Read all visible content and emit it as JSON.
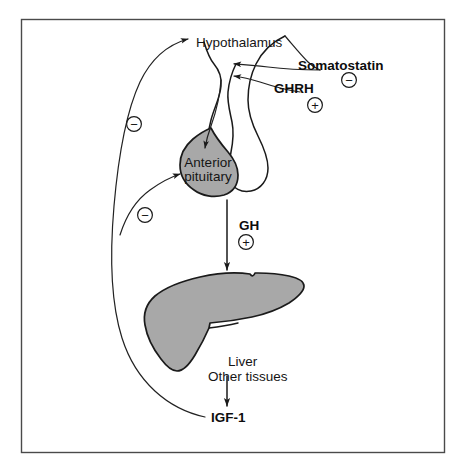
{
  "figure": {
    "background_color": "#ffffff",
    "frame_color": "#4a4a4a",
    "organ_fill_color": "#a8a8a8",
    "organ_outline_color": "#1a1a1a",
    "line_color": "#1a1a1a"
  },
  "labels": {
    "hypothalamus": "Hypothalamus",
    "somatostatin": "Somatostatin",
    "ghrh": "GHRH",
    "anterior_pituitary_line1": "Anterior",
    "anterior_pituitary_line2": "pituitary",
    "gh": "GH",
    "liver_line1": "Liver",
    "liver_line2": "Other tissues",
    "igf1": "IGF-1"
  },
  "signs": {
    "somatostatin_sign": "−",
    "ghrh_sign": "+",
    "gh_sign": "+",
    "feedback_upper_sign": "−",
    "feedback_lower_sign": "−"
  },
  "icons": {
    "minus_circle": "minus-in-circle-icon",
    "plus_circle": "plus-in-circle-icon",
    "arrowhead": "arrowhead-icon"
  },
  "relationships": [
    {
      "from": "Somatostatin",
      "to": "Hypothalamic-pituitary stalk",
      "effect": "−",
      "type": "inhibition"
    },
    {
      "from": "GHRH",
      "to": "Hypothalamic-pituitary stalk",
      "effect": "+",
      "type": "stimulation"
    },
    {
      "from": "Hypothalamus",
      "to": "Anterior pituitary",
      "effect": "",
      "type": "release"
    },
    {
      "from": "Anterior pituitary",
      "to": "Liver / Other tissues",
      "effect": "+",
      "type": "GH secretion"
    },
    {
      "from": "Liver / Other tissues",
      "to": "IGF-1",
      "effect": "",
      "type": "production"
    },
    {
      "from": "IGF-1",
      "to": "Hypothalamus",
      "effect": "−",
      "type": "negative feedback"
    },
    {
      "from": "IGF-1",
      "to": "Anterior pituitary",
      "effect": "−",
      "type": "negative feedback"
    }
  ]
}
